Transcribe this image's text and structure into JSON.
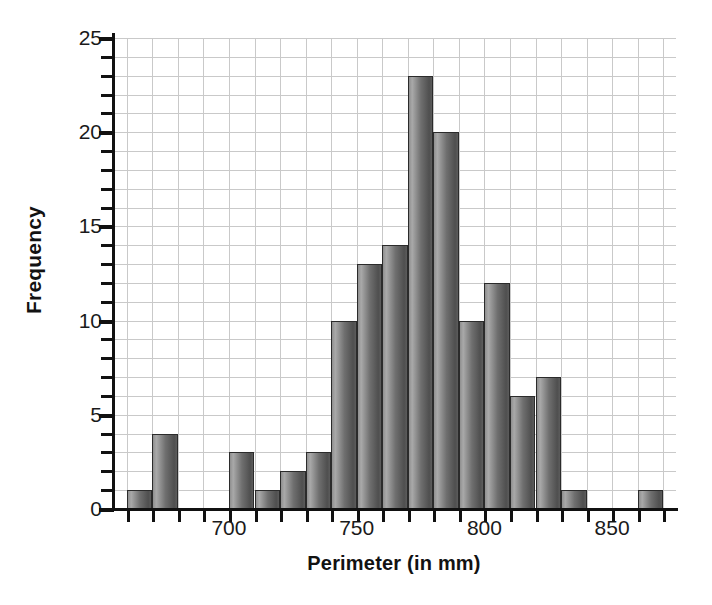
{
  "chart_data": {
    "type": "bar",
    "title": "",
    "xlabel": "Perimeter (in mm)",
    "ylabel": "Frequency",
    "grid": true,
    "legend": "none",
    "bin_width": 10,
    "bin_starts": [
      660,
      670,
      680,
      690,
      700,
      710,
      720,
      730,
      740,
      750,
      760,
      770,
      780,
      790,
      800,
      810,
      820,
      830,
      840,
      850,
      860
    ],
    "categories": [
      "660-670",
      "670-680",
      "680-690",
      "690-700",
      "700-710",
      "710-720",
      "720-730",
      "730-740",
      "740-750",
      "750-760",
      "760-770",
      "770-780",
      "780-790",
      "790-800",
      "800-810",
      "810-820",
      "820-830",
      "830-840",
      "840-850",
      "850-860",
      "860-870"
    ],
    "values": [
      1,
      4,
      0,
      0,
      3,
      1,
      2,
      3,
      10,
      13,
      14,
      23,
      20,
      10,
      12,
      6,
      7,
      1,
      0,
      0,
      1
    ],
    "xlim": [
      655,
      875
    ],
    "ylim": [
      0,
      25
    ],
    "ytick_labels": [
      "0",
      "5",
      "10",
      "15",
      "20",
      "25"
    ],
    "ytick_values": [
      0,
      5,
      10,
      15,
      20,
      25
    ],
    "ytick_minor_step": 1,
    "xtick_labels": [
      "700",
      "750",
      "800",
      "850"
    ],
    "xtick_values": [
      700,
      750,
      800,
      850
    ],
    "xtick_minor_step": 10,
    "bar_color": "#6f6f6f",
    "bar_edge_color": "#2b2b2b",
    "grid_color": "#c9c9c9",
    "axis_color": "#111111"
  }
}
